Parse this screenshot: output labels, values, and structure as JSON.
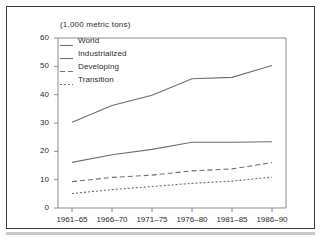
{
  "figure": {
    "unit_title": "(1,000 metric tons)",
    "frame_color": "#3a3a3a",
    "background": "#ffffff",
    "line_color": "#6f6f6f",
    "axis_color": "#8c8c8c",
    "text_color": "#2b2b2b"
  },
  "legend": {
    "position": "top-left-inside",
    "items": [
      {
        "label": "World",
        "style": "solid",
        "swatch_name": "legend-swatch-world"
      },
      {
        "label": "Industrialized",
        "style": "solid",
        "swatch_name": "legend-swatch-industrialized"
      },
      {
        "label": "Developing",
        "style": "dashed",
        "swatch_name": "legend-swatch-developing"
      },
      {
        "label": "Transition",
        "style": "dotted",
        "swatch_name": "legend-swatch-transition"
      }
    ]
  },
  "chart_data": {
    "type": "line",
    "title": "(1,000 metric tons)",
    "xlabel": "",
    "ylabel": "",
    "ylim": [
      0,
      60
    ],
    "yticks": [
      0,
      10,
      20,
      30,
      40,
      50,
      60
    ],
    "grid": false,
    "legend_position": "upper left inside plot",
    "categories": [
      "1961–65",
      "1966–70",
      "1971–75",
      "1976–80",
      "1981–85",
      "1986–90"
    ],
    "series": [
      {
        "name": "World",
        "style": "solid",
        "values": [
          30.3,
          36.2,
          39.8,
          45.6,
          46.1,
          50.3
        ]
      },
      {
        "name": "Industrialized",
        "style": "solid",
        "values": [
          16.1,
          18.8,
          20.7,
          23.2,
          23.2,
          23.4
        ]
      },
      {
        "name": "Developing",
        "style": "dashed",
        "values": [
          9.3,
          10.8,
          11.6,
          13.1,
          13.8,
          16.0
        ]
      },
      {
        "name": "Transition",
        "style": "dotted",
        "values": [
          5.1,
          6.5,
          7.6,
          8.7,
          9.5,
          10.9
        ]
      }
    ]
  }
}
